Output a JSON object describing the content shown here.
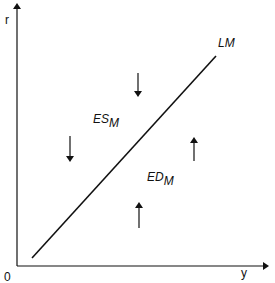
{
  "diagram": {
    "title": "",
    "type": "LM curve diagram",
    "axes": {
      "y_axis_label": "r",
      "x_axis_label": "y",
      "origin_label": "0"
    },
    "curve": {
      "label": "LM",
      "from": [
        32,
        258
      ],
      "to": [
        216,
        56
      ]
    },
    "regions": {
      "excess_supply": {
        "label": "ES",
        "subscript": "M",
        "arrows": [
          "down",
          "down"
        ]
      },
      "excess_demand": {
        "label": "ED",
        "subscript": "M",
        "arrows": [
          "up",
          "up"
        ]
      }
    },
    "colors": {
      "line": "#111111",
      "background": "#ffffff"
    }
  }
}
